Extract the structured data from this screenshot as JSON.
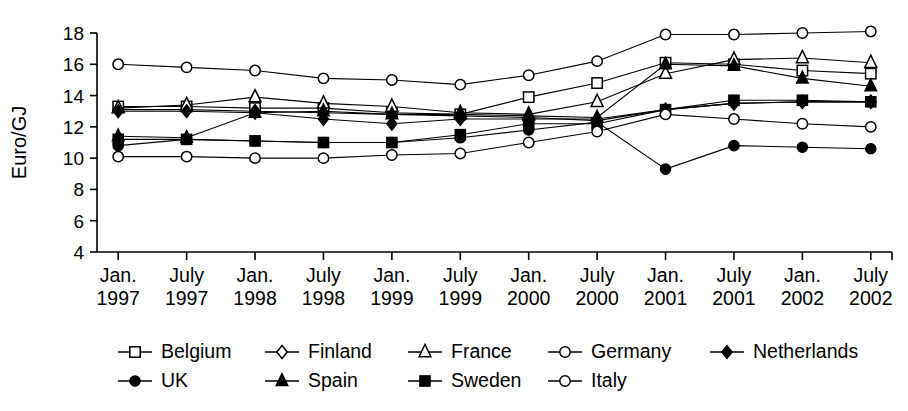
{
  "chart_data": {
    "type": "line",
    "title": "",
    "xlabel": "",
    "ylabel": "Euro/GJ",
    "ylim": [
      4,
      18
    ],
    "yticks": [
      4,
      6,
      8,
      10,
      12,
      14,
      16,
      18
    ],
    "grid": false,
    "legend_position": "bottom",
    "categories": [
      "Jan. 1997",
      "July 1997",
      "Jan. 1998",
      "July 1998",
      "Jan. 1999",
      "July 1999",
      "Jan. 2000",
      "July 2000",
      "Jan. 2001",
      "July 2001",
      "Jan. 2002",
      "July 2002"
    ],
    "category_lines": [
      [
        "Jan.",
        "1997"
      ],
      [
        "July",
        "1997"
      ],
      [
        "Jan.",
        "1998"
      ],
      [
        "July",
        "1998"
      ],
      [
        "Jan.",
        "1999"
      ],
      [
        "July",
        "1999"
      ],
      [
        "Jan.",
        "2000"
      ],
      [
        "July",
        "2000"
      ],
      [
        "Jan.",
        "2001"
      ],
      [
        "July",
        "2001"
      ],
      [
        "Jan.",
        "2002"
      ],
      [
        "July",
        "2002"
      ]
    ],
    "series": [
      {
        "name": "Belgium",
        "marker": "open-square",
        "values": [
          13.3,
          13.3,
          13.2,
          13.2,
          12.9,
          12.8,
          13.9,
          14.8,
          16.1,
          16.0,
          15.6,
          15.4
        ]
      },
      {
        "name": "Finland",
        "marker": "open-diamond",
        "values": [
          13.1,
          13.1,
          13.0,
          12.9,
          12.8,
          12.7,
          12.6,
          12.4,
          13.1,
          13.5,
          13.6,
          13.6
        ]
      },
      {
        "name": "France",
        "marker": "open-triangle",
        "values": [
          13.2,
          13.4,
          13.9,
          13.5,
          13.3,
          12.9,
          12.8,
          13.6,
          15.4,
          16.3,
          16.4,
          16.1
        ]
      },
      {
        "name": "Germany",
        "marker": "open-circle",
        "values": [
          16.0,
          15.8,
          15.6,
          15.1,
          15.0,
          14.7,
          15.3,
          16.2,
          17.9,
          17.9,
          18.0,
          18.1
        ]
      },
      {
        "name": "Netherlands",
        "marker": "filled-diamond",
        "values": [
          13.0,
          13.0,
          12.9,
          12.5,
          12.2,
          12.5,
          12.5,
          12.5,
          13.1,
          13.5,
          13.6,
          13.6
        ]
      },
      {
        "name": "UK",
        "marker": "filled-circle",
        "values": [
          10.8,
          11.2,
          11.1,
          11.0,
          11.0,
          11.3,
          11.8,
          12.3,
          9.3,
          10.8,
          10.7,
          10.6
        ]
      },
      {
        "name": "Spain",
        "marker": "filled-triangle",
        "values": [
          11.4,
          11.3,
          12.9,
          13.0,
          12.8,
          12.8,
          12.7,
          12.6,
          16.0,
          15.9,
          15.1,
          14.6
        ]
      },
      {
        "name": "Sweden",
        "marker": "filled-square",
        "values": [
          11.2,
          11.2,
          11.1,
          11.0,
          11.0,
          11.5,
          12.2,
          12.2,
          13.1,
          13.7,
          13.7,
          13.6
        ]
      },
      {
        "name": "Italy",
        "marker": "open-circle",
        "values": [
          10.1,
          10.1,
          10.0,
          10.0,
          10.2,
          10.3,
          11.0,
          11.7,
          12.8,
          12.5,
          12.2,
          12.0
        ]
      }
    ]
  },
  "legend": {
    "rows": [
      [
        "Belgium",
        "Finland",
        "France",
        "Germany",
        "Netherlands"
      ],
      [
        "UK",
        "Spain",
        "Sweden",
        "Italy"
      ]
    ]
  }
}
